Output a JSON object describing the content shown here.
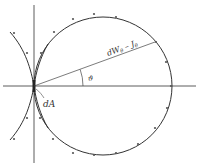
{
  "diagram": {
    "type": "polar-intensity-diagram",
    "labels": {
      "radius": "dWθ – Jθ",
      "radius_main": "dW",
      "radius_sub1": "θ",
      "radius_mid": " – J",
      "radius_sub2": "θ",
      "angle": "ϑ",
      "element": "dA"
    },
    "colors": {
      "background": "#ffffff",
      "stroke": "#333333",
      "dots": "#555555"
    },
    "axes": {
      "horizontal": {
        "x1": 3,
        "y1": 86,
        "x2": 196,
        "y2": 86
      },
      "vertical": {
        "x1": 34,
        "y1": 5,
        "x2": 34,
        "y2": 163
      }
    },
    "circle": {
      "cx": 103,
      "cy": 86,
      "r": 69
    },
    "radius_line": {
      "x1": 34,
      "y1": 86,
      "x2": 155,
      "y2": 42
    },
    "dots": [
      [
        14,
        33
      ],
      [
        27,
        53
      ],
      [
        54,
        32
      ],
      [
        73,
        19
      ],
      [
        94,
        14
      ],
      [
        116,
        17
      ],
      [
        156,
        42
      ],
      [
        166,
        62
      ],
      [
        171,
        86
      ],
      [
        167,
        108
      ],
      [
        155,
        128
      ],
      [
        138,
        144
      ],
      [
        116,
        153
      ],
      [
        94,
        155
      ],
      [
        73,
        153
      ],
      [
        53,
        139
      ],
      [
        40,
        118
      ],
      [
        27,
        118
      ],
      [
        14,
        139
      ],
      [
        41,
        53
      ]
    ]
  }
}
